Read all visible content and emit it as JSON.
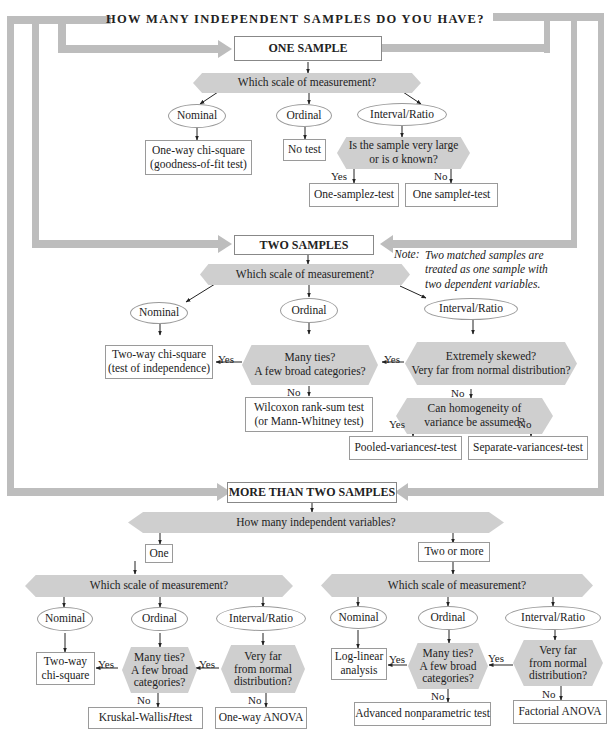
{
  "title": "HOW MANY INDEPENDENT SAMPLES DO YOU HAVE?",
  "colors": {
    "frame": "#bdbdbd",
    "hexagon": "#cfcfcf",
    "box_border": "#9a9a9a",
    "arrow": "#222222"
  },
  "one_sample": {
    "header": "ONE SAMPLE",
    "question": "Which scale of measurement?",
    "scales": [
      "Nominal",
      "Ordinal",
      "Interval/Ratio"
    ],
    "nominal_test_line1": "One-way chi-square",
    "nominal_test_line2": "(goodness-of-fit test)",
    "ordinal_test": "No test",
    "interval_question_line1": "Is the sample very large",
    "interval_question_line2": "or is σ known?",
    "yes": "Yes",
    "no": "No",
    "yes_test": "One-sample z-test",
    "yes_test_pre": "One-sample ",
    "yes_test_var": "z",
    "yes_test_post": "-test",
    "no_test_pre": "One sample ",
    "no_test_var": "t",
    "no_test_post": "-test"
  },
  "two_samples": {
    "header": "TWO SAMPLES",
    "note_prefix": "Note:",
    "note_line1": "Two matched samples are",
    "note_line2": "treated as one sample with",
    "note_line3": "two dependent variables.",
    "question": "Which scale of measurement?",
    "scales": [
      "Nominal",
      "Ordinal",
      "Interval/Ratio"
    ],
    "nominal_test_line1": "Two-way chi-square",
    "nominal_test_line2": "(test of independence)",
    "ordinal_question_line1": "Many ties?",
    "ordinal_question_line2": "A few broad categories?",
    "ordinal_no_test_line1": "Wilcoxon rank-sum test",
    "ordinal_no_test_line2": "(or Mann-Whitney test)",
    "interval_question_line1": "Extremely skewed?",
    "interval_question_line2": "Very far from normal distribution?",
    "variance_question_line1": "Can homogeneity of",
    "variance_question_line2": "variance be assumed?",
    "yes": "Yes",
    "no": "No",
    "pooled_pre": "Pooled-variances ",
    "pooled_var": "t",
    "pooled_post": "-test",
    "separate_pre": "Separate-variances ",
    "separate_var": "t",
    "separate_post": "-test"
  },
  "more_than_two": {
    "header": "MORE THAN TWO SAMPLES",
    "question": "How many independent variables?",
    "branch_one": "One",
    "branch_two": "Two or more",
    "yes": "Yes",
    "no": "No",
    "one": {
      "question": "Which scale of measurement?",
      "scales": [
        "Nominal",
        "Ordinal",
        "Interval/Ratio"
      ],
      "nominal_test_line1": "Two-way",
      "nominal_test_line2": "chi-square",
      "ordinal_question_line1": "Many ties?",
      "ordinal_question_line2": "A few broad",
      "ordinal_question_line3": "categories?",
      "interval_question_line1": "Very far",
      "interval_question_line2": "from normal",
      "interval_question_line3": "distribution?",
      "ordinal_no_pre": "Kruskal-Wallis ",
      "ordinal_no_var": "H",
      "ordinal_no_post": " test",
      "interval_no_test": "One-way ANOVA"
    },
    "two": {
      "question": "Which scale of measurement?",
      "scales": [
        "Nominal",
        "Ordinal",
        "Interval/Ratio"
      ],
      "nominal_test_line1": "Log-linear",
      "nominal_test_line2": "analysis",
      "ordinal_question_line1": "Many ties?",
      "ordinal_question_line2": "A few broad",
      "ordinal_question_line3": "categories?",
      "interval_question_line1": "Very far",
      "interval_question_line2": "from normal",
      "interval_question_line3": "distribution?",
      "ordinal_no_test": "Advanced nonparametric test",
      "interval_no_test": "Factorial ANOVA"
    }
  }
}
